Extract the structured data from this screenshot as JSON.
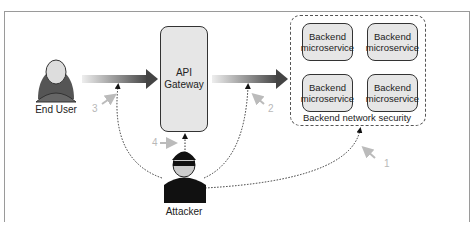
{
  "diagram": {
    "actors": {
      "end_user": "End User",
      "attacker": "Attacker"
    },
    "gateway": {
      "line1": "API",
      "line2": "Gateway"
    },
    "microservices": [
      {
        "line1": "Backend",
        "line2": "microservice"
      },
      {
        "line1": "Backend",
        "line2": "microservice"
      },
      {
        "line1": "Backend",
        "line2": "microservice"
      },
      {
        "line1": "Backend",
        "line2": "microservice"
      }
    ],
    "network_label": "Backend network security",
    "attack_numbers": [
      "1",
      "2",
      "3",
      "4"
    ],
    "colors": {
      "arrow_dark": "#444444",
      "box_fill": "#e6e6e6",
      "number_gray": "#b8b8b8"
    }
  }
}
